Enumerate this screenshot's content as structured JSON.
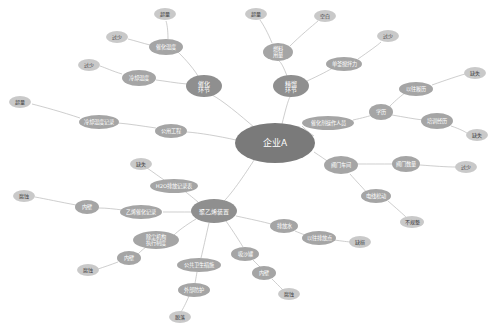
{
  "diagram": {
    "type": "mind-map",
    "background": "#ffffff",
    "edge_color": "#b9b9b9",
    "palette": {
      "center": "#7a7a7a",
      "major": "#8f8f8f",
      "mid": "#a5a5a5",
      "leaf": "#c9c9c9",
      "label_light": "#ffffff",
      "label_dark": "#3a3a3a"
    },
    "nodes": [
      {
        "id": "n0",
        "label": "企业A",
        "x": 275,
        "y": 143,
        "rx": 40,
        "ry": 20,
        "tier": "center"
      },
      {
        "id": "n1",
        "label": "催化环节",
        "x": 204,
        "y": 86,
        "rx": 18,
        "ry": 11,
        "tier": "major",
        "lines": [
          "催化",
          "环节"
        ]
      },
      {
        "id": "n2",
        "label": "精馏环节",
        "x": 291,
        "y": 86,
        "rx": 18,
        "ry": 11,
        "tier": "major",
        "lines": [
          "精馏",
          "环节"
        ]
      },
      {
        "id": "n3",
        "label": "聚乙烯装置",
        "x": 214,
        "y": 211,
        "rx": 23,
        "ry": 12,
        "tier": "major"
      },
      {
        "id": "n4",
        "label": "催化温度",
        "x": 166,
        "y": 47,
        "rx": 17,
        "ry": 8,
        "tier": "mid"
      },
      {
        "id": "n5",
        "label": "冷却温度",
        "x": 139,
        "y": 78,
        "rx": 17,
        "ry": 8,
        "tier": "mid"
      },
      {
        "id": "n6",
        "label": "燃料用量",
        "x": 278,
        "y": 52,
        "rx": 15,
        "ry": 9,
        "tier": "mid",
        "lines": [
          "燃料",
          "用量"
        ]
      },
      {
        "id": "n7",
        "label": "单釜搅拌力",
        "x": 344,
        "y": 64,
        "rx": 18,
        "ry": 7,
        "tier": "mid"
      },
      {
        "id": "n8",
        "label": "催化剂操作人员",
        "x": 328,
        "y": 123,
        "rx": 26,
        "ry": 7,
        "tier": "mid"
      },
      {
        "id": "n9",
        "label": "学历",
        "x": 381,
        "y": 112,
        "rx": 12,
        "ry": 8,
        "tier": "mid"
      },
      {
        "id": "n10",
        "label": "以往履历",
        "x": 416,
        "y": 89,
        "rx": 17,
        "ry": 7,
        "tier": "mid"
      },
      {
        "id": "n11",
        "label": "培训经历",
        "x": 437,
        "y": 121,
        "rx": 16,
        "ry": 8,
        "tier": "mid"
      },
      {
        "id": "n12",
        "label": "阀门车间",
        "x": 341,
        "y": 165,
        "rx": 17,
        "ry": 9,
        "tier": "mid"
      },
      {
        "id": "n13",
        "label": "阀门数量",
        "x": 406,
        "y": 164,
        "rx": 14,
        "ry": 8,
        "tier": "mid"
      },
      {
        "id": "n14",
        "label": "电线松动",
        "x": 376,
        "y": 196,
        "rx": 15,
        "ry": 7,
        "tier": "mid"
      },
      {
        "id": "n15",
        "label": "公用工程",
        "x": 171,
        "y": 131,
        "rx": 16,
        "ry": 7,
        "tier": "mid"
      },
      {
        "id": "n16",
        "label": "冷却温度记录",
        "x": 99,
        "y": 122,
        "rx": 20,
        "ry": 7,
        "tier": "mid"
      },
      {
        "id": "n17",
        "label": "H2O排放记录表",
        "x": 174,
        "y": 186,
        "rx": 24,
        "ry": 7,
        "tier": "mid"
      },
      {
        "id": "n18",
        "label": "乙烯催化记录",
        "x": 141,
        "y": 212,
        "rx": 21,
        "ry": 7,
        "tier": "mid"
      },
      {
        "id": "n19",
        "label": "内壁",
        "x": 87,
        "y": 207,
        "rx": 12,
        "ry": 7,
        "tier": "mid"
      },
      {
        "id": "n20",
        "label": "除尘机构执行制度",
        "x": 156,
        "y": 240,
        "rx": 23,
        "ry": 9,
        "tier": "mid",
        "lines": [
          "除尘机构",
          "执行制度"
        ]
      },
      {
        "id": "n21",
        "label": "内壁",
        "x": 129,
        "y": 258,
        "rx": 12,
        "ry": 7,
        "tier": "mid"
      },
      {
        "id": "n22",
        "label": "公共卫生措施",
        "x": 199,
        "y": 265,
        "rx": 22,
        "ry": 7,
        "tier": "mid"
      },
      {
        "id": "n23",
        "label": "外部防护",
        "x": 194,
        "y": 290,
        "rx": 16,
        "ry": 7,
        "tier": "mid"
      },
      {
        "id": "n24",
        "label": "吸沙罐",
        "x": 245,
        "y": 254,
        "rx": 14,
        "ry": 7,
        "tier": "mid"
      },
      {
        "id": "n25",
        "label": "内壁",
        "x": 264,
        "y": 273,
        "rx": 12,
        "ry": 7,
        "tier": "mid"
      },
      {
        "id": "n26",
        "label": "排放水",
        "x": 284,
        "y": 226,
        "rx": 14,
        "ry": 7,
        "tier": "mid"
      },
      {
        "id": "n27",
        "label": "以往排放点",
        "x": 319,
        "y": 238,
        "rx": 17,
        "ry": 7,
        "tier": "mid"
      },
      {
        "id": "L1",
        "label": "超量",
        "x": 165,
        "y": 14,
        "rx": 11,
        "ry": 6,
        "tier": "leaf"
      },
      {
        "id": "L2",
        "label": "过少",
        "x": 117,
        "y": 37,
        "rx": 11,
        "ry": 6,
        "tier": "leaf"
      },
      {
        "id": "L3",
        "label": "过少",
        "x": 89,
        "y": 65,
        "rx": 11,
        "ry": 6,
        "tier": "leaf"
      },
      {
        "id": "L4",
        "label": "超量",
        "x": 256,
        "y": 14,
        "rx": 11,
        "ry": 6,
        "tier": "leaf"
      },
      {
        "id": "L5",
        "label": "空白",
        "x": 325,
        "y": 16,
        "rx": 11,
        "ry": 6,
        "tier": "leaf"
      },
      {
        "id": "L6",
        "label": "过少",
        "x": 388,
        "y": 36,
        "rx": 11,
        "ry": 6,
        "tier": "leaf"
      },
      {
        "id": "L7",
        "label": "缺失",
        "x": 475,
        "y": 73,
        "rx": 11,
        "ry": 6,
        "tier": "leaf"
      },
      {
        "id": "L8",
        "label": "缺失",
        "x": 477,
        "y": 135,
        "rx": 11,
        "ry": 6,
        "tier": "leaf"
      },
      {
        "id": "L9",
        "label": "过少",
        "x": 466,
        "y": 167,
        "rx": 11,
        "ry": 6,
        "tier": "leaf"
      },
      {
        "id": "L10",
        "label": "不规整",
        "x": 412,
        "y": 222,
        "rx": 12,
        "ry": 6,
        "tier": "leaf"
      },
      {
        "id": "L11",
        "label": "缺损",
        "x": 360,
        "y": 242,
        "rx": 11,
        "ry": 6,
        "tier": "leaf"
      },
      {
        "id": "L12",
        "label": "腐蚀",
        "x": 289,
        "y": 294,
        "rx": 11,
        "ry": 6,
        "tier": "leaf"
      },
      {
        "id": "L13",
        "label": "脱落",
        "x": 180,
        "y": 317,
        "rx": 11,
        "ry": 6,
        "tier": "leaf"
      },
      {
        "id": "L14",
        "label": "腐蚀",
        "x": 88,
        "y": 270,
        "rx": 11,
        "ry": 6,
        "tier": "leaf"
      },
      {
        "id": "L15",
        "label": "腐蚀",
        "x": 24,
        "y": 196,
        "rx": 11,
        "ry": 6,
        "tier": "leaf"
      },
      {
        "id": "L16",
        "label": "缺失",
        "x": 141,
        "y": 164,
        "rx": 11,
        "ry": 6,
        "tier": "leaf"
      },
      {
        "id": "L17",
        "label": "超量",
        "x": 20,
        "y": 102,
        "rx": 11,
        "ry": 6,
        "tier": "leaf"
      }
    ],
    "edges": [
      {
        "from": "n0",
        "to": "n1",
        "curve": "M255,128 C240,115 222,100 212,95"
      },
      {
        "from": "n0",
        "to": "n2",
        "curve": "M282,124 C285,112 288,100 290,97"
      },
      {
        "from": "n0",
        "to": "n3",
        "curve": "M256,157 C244,176 230,196 222,203"
      },
      {
        "from": "n0",
        "to": "n8",
        "curve": "M314,136 C308,132 304,128 302,126"
      },
      {
        "from": "n0",
        "to": "n12",
        "curve": "M314,152 C320,156 326,160 330,163"
      },
      {
        "from": "n0",
        "to": "n15",
        "curve": "M236,140 C218,136 200,133 187,132"
      },
      {
        "from": "n1",
        "to": "n4",
        "curve": "M198,76 C192,66 182,56 178,52"
      },
      {
        "from": "n1",
        "to": "n5",
        "curve": "M187,84 C175,83 165,81 156,80"
      },
      {
        "from": "n4",
        "to": "L1",
        "curve": "M168,39 C168,30 167,24 166,21"
      },
      {
        "from": "n4",
        "to": "L2",
        "curve": "M150,45 C142,43 136,41 128,39"
      },
      {
        "from": "n5",
        "to": "L3",
        "curve": "M122,74 C112,71 106,68 100,66"
      },
      {
        "from": "n2",
        "to": "n6",
        "curve": "M287,76 C284,68 281,62 279,61"
      },
      {
        "from": "n2",
        "to": "n7",
        "curve": "M307,81 C318,76 330,70 334,67"
      },
      {
        "from": "n6",
        "to": "L4",
        "curve": "M272,43 C268,33 263,24 260,20"
      },
      {
        "from": "n6",
        "to": "L5",
        "curve": "M290,46 C300,36 312,26 318,21"
      },
      {
        "from": "n7",
        "to": "L6",
        "curve": "M358,59 C368,52 378,45 381,42"
      },
      {
        "from": "n8",
        "to": "n9",
        "curve": "M353,120 C362,118 370,116 372,115"
      },
      {
        "from": "n9",
        "to": "n10",
        "curve": "M390,106 C396,100 402,95 405,93"
      },
      {
        "from": "n9",
        "to": "n11",
        "curve": "M392,115 C404,117 414,119 423,120"
      },
      {
        "from": "n10",
        "to": "L7",
        "curve": "M432,85 C446,80 458,76 465,74"
      },
      {
        "from": "n11",
        "to": "L8",
        "curve": "M451,126 C460,129 466,132 468,134"
      },
      {
        "from": "n12",
        "to": "n13",
        "curve": "M357,164 C370,164 382,164 393,164"
      },
      {
        "from": "n12",
        "to": "n14",
        "curve": "M350,174 C356,181 364,189 367,193"
      },
      {
        "from": "n13",
        "to": "L9",
        "curve": "M420,165 C434,166 446,167 456,167"
      },
      {
        "from": "n14",
        "to": "L10",
        "curve": "M388,201 C396,208 404,215 407,218"
      },
      {
        "from": "n15",
        "to": "n16",
        "curve": "M156,128 C142,126 130,124 118,123"
      },
      {
        "from": "n16",
        "to": "L17",
        "curve": "M80,118 C62,112 44,107 32,104"
      },
      {
        "from": "n3",
        "to": "n17",
        "curve": "M198,202 C192,197 186,192 183,190"
      },
      {
        "from": "n3",
        "to": "n18",
        "curve": "M192,212 C182,212 172,212 163,212"
      },
      {
        "from": "n3",
        "to": "n20",
        "curve": "M196,219 C186,225 178,231 174,235"
      },
      {
        "from": "n3",
        "to": "n22",
        "curve": "M209,223 C206,236 203,250 201,258"
      },
      {
        "from": "n3",
        "to": "n24",
        "curve": "M226,221 C233,231 240,242 243,247"
      },
      {
        "from": "n3",
        "to": "n26",
        "curve": "M236,216 C250,219 264,222 271,224"
      },
      {
        "from": "n17",
        "to": "L16",
        "curve": "M164,180 C157,175 150,170 147,168"
      },
      {
        "from": "n18",
        "to": "n19",
        "curve": "M123,210 C114,209 107,208 99,208"
      },
      {
        "from": "n19",
        "to": "L15",
        "curve": "M76,205 C60,202 46,199 35,197"
      },
      {
        "from": "n20",
        "to": "n21",
        "curve": "M146,247 C142,250 139,253 137,255"
      },
      {
        "from": "n21",
        "to": "L14",
        "curve": "M118,262 C110,265 104,267 98,269"
      },
      {
        "from": "n22",
        "to": "n23",
        "curve": "M197,272 C196,278 195,283 195,284"
      },
      {
        "from": "n23",
        "to": "L13",
        "curve": "M189,296 C186,303 183,309 181,312"
      },
      {
        "from": "n24",
        "to": "n25",
        "curve": "M253,260 C257,264 260,267 262,269"
      },
      {
        "from": "n25",
        "to": "L12",
        "curve": "M272,279 C277,284 282,289 284,291"
      },
      {
        "from": "n26",
        "to": "n27",
        "curve": "M295,231 C302,234 308,236 311,237"
      },
      {
        "from": "n27",
        "to": "L11",
        "curve": "M334,240 C342,241 348,242 352,242"
      }
    ]
  }
}
